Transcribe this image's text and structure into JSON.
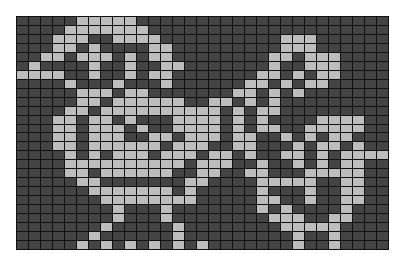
{
  "pattern": {
    "columns": 31,
    "rows": 26,
    "colors": {
      "background": "#ffffff",
      "grid_line": "#111111",
      "off_cell": "#444444",
      "on_cell": "#bdbdbd"
    },
    "cells": [
      ".....LLLLL.....................",
      "....LLLLLLL....................",
      "...LLL..LLLL..........LLL......",
      "...LL.L....LL.........LLL......",
      "..LL.LLL.L.LL........LL.LLL....",
      ".L....L..L..LL.......L..LLL....",
      "LLLL..L..L.LL.......LL.L.LL....",
      "....L...L...L......LL.L.LL.....",
      ".....LLL.LL.......LL.L.L.......",
      ".....LL.LLLLLL..LL.L.L.........",
      "....LL.LLLLLLLLLL.L.LL.........",
      "...LL.LL.L...LLLL.L.L....LLLL..",
      "...LL.LLL.L..LLLL.L.LL..LLLLL..",
      "...LL.LLL..LL.LLL.LL..L.L.LL...",
      "...LL.LLLLLL.LLL..LL...L.LL.L..",
      "....L.L.LLL.LLL.LL.L..LL.L.LLLL",
      "....LLLLLLLLLL.LLL..L..L.L.LL..",
      "....LL.LLLLLL..LL..LL...LLLLL..",
      ".....LL.......LL....LLLLL..LL..",
      "......LLLLLLL.L.....L...L..LL..",
      ".......LLLLLLLL.....LL..L..LL..",
      "........L...L.......L.L....L...",
      "........L...L........LLL..LL...",
      ".......L.....L........LLLLL....",
      "......L......L.........L..L....",
      ".....L.L.L.L.L.L.......L..L...."
    ]
  }
}
